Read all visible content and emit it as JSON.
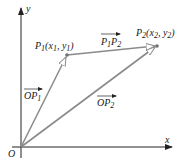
{
  "axes": {
    "x_label": "x",
    "y_label": "y",
    "origin_label": "O"
  },
  "points": {
    "p1": {
      "name": "P",
      "sub": "1",
      "coords_open": "(x",
      "coords_sub1": "1",
      "coords_mid": ", y",
      "coords_sub2": "1",
      "coords_close": ")"
    },
    "p2": {
      "name": "P",
      "sub": "2",
      "coords_open": "(x",
      "coords_sub1": "2",
      "coords_mid": ", y",
      "coords_sub2": "2",
      "coords_close": ")"
    }
  },
  "vectors": {
    "op1": {
      "main": "OP",
      "sub": "1"
    },
    "op2": {
      "main": "OP",
      "sub": "2"
    },
    "p1p2": {
      "a": "P",
      "a_sub": "1",
      "b": "P",
      "b_sub": "2"
    }
  },
  "colors": {
    "vector": "#8a8a8a",
    "axis": "#222222",
    "point": "#707070"
  }
}
